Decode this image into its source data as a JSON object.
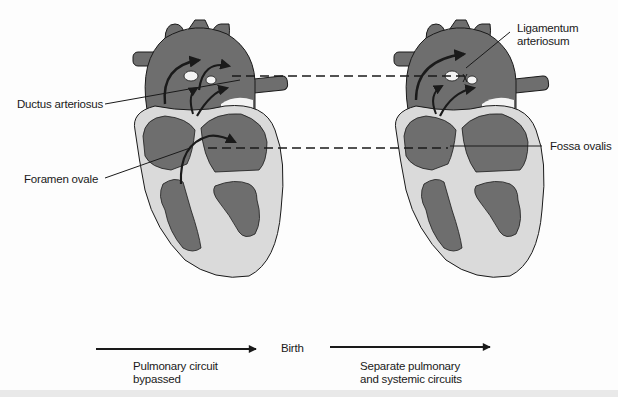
{
  "colors": {
    "chamber": "#6e6e6e",
    "wall": "#dadada",
    "outline": "#1a1a1a",
    "text": "#1a1a1a",
    "background": "#fdfdfd"
  },
  "labels": {
    "ductus_arteriosus": "Ductus arteriosus",
    "foramen_ovale": "Foramen ovale",
    "ligamentum_line1": "Ligamentum",
    "ligamentum_line2": "arteriosum",
    "fossa_ovalis": "Fossa ovalis",
    "birth": "Birth",
    "pulmonary_line1": "Pulmonary circuit",
    "pulmonary_line2": "bypassed",
    "separate_line1": "Separate pulmonary",
    "separate_line2": "and systemic circuits"
  },
  "figures": [
    {
      "name": "fetal-heart",
      "state": "before birth"
    },
    {
      "name": "postnatal-heart",
      "state": "after birth"
    }
  ]
}
